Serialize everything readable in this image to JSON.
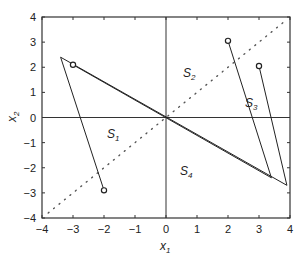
{
  "chart_data": {
    "type": "line",
    "title": "",
    "xlabel": "x1",
    "ylabel": "x2",
    "xlim": [
      -4,
      4
    ],
    "ylim": [
      -4,
      4
    ],
    "grid": false,
    "xticks": [
      -4,
      -3,
      -2,
      -1,
      0,
      1,
      2,
      3,
      4
    ],
    "yticks": [
      -4,
      -3,
      -2,
      -1,
      0,
      1,
      2,
      3,
      4
    ],
    "reference_lines": [
      {
        "name": "x1-axis",
        "points": [
          [
            -4,
            0
          ],
          [
            4,
            0
          ]
        ],
        "style": "solid"
      },
      {
        "name": "x2-axis",
        "points": [
          [
            0,
            -4
          ],
          [
            0,
            4
          ]
        ],
        "style": "solid"
      },
      {
        "name": "diagonal",
        "points": [
          [
            -3.8,
            -3.8
          ],
          [
            3.8,
            3.8
          ]
        ],
        "style": "dotted"
      }
    ],
    "series": [
      {
        "name": "trajectory-1",
        "start_marker": "circle",
        "points": [
          [
            -2,
            -2.9
          ],
          [
            -3.4,
            2.4
          ],
          [
            3.9,
            -2.7
          ]
        ]
      },
      {
        "name": "trajectory-2",
        "start_marker": "circle",
        "points": [
          [
            -3,
            2.1
          ],
          [
            3.4,
            -2.4
          ]
        ]
      },
      {
        "name": "trajectory-3",
        "start_marker": "circle",
        "points": [
          [
            2,
            3.05
          ],
          [
            3.4,
            -2.4
          ]
        ]
      },
      {
        "name": "trajectory-4",
        "start_marker": "circle",
        "points": [
          [
            3,
            2.05
          ],
          [
            3.9,
            -2.7
          ]
        ]
      }
    ],
    "annotations": [
      {
        "text": "S1",
        "x": -1.9,
        "y": -0.8
      },
      {
        "text": "S2",
        "x": 0.55,
        "y": 1.6
      },
      {
        "text": "S3",
        "x": 2.55,
        "y": 0.4
      },
      {
        "text": "S4",
        "x": 0.45,
        "y": -2.3
      }
    ]
  }
}
